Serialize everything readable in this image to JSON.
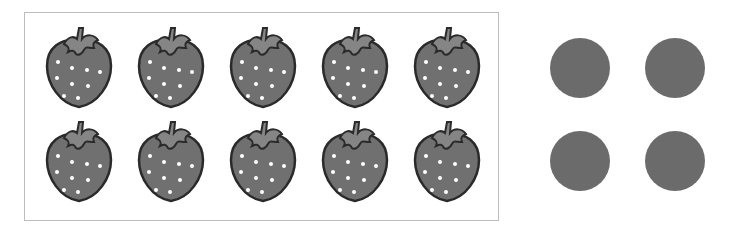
{
  "frame": {
    "label": "strawberries",
    "count": 10,
    "rows": 2,
    "columns": 5,
    "items": [
      {
        "kind": "strawberry"
      },
      {
        "kind": "strawberry"
      },
      {
        "kind": "strawberry"
      },
      {
        "kind": "strawberry"
      },
      {
        "kind": "strawberry"
      },
      {
        "kind": "strawberry"
      },
      {
        "kind": "strawberry"
      },
      {
        "kind": "strawberry"
      },
      {
        "kind": "strawberry"
      },
      {
        "kind": "strawberry"
      }
    ]
  },
  "dots": {
    "count": 4,
    "rows": 2,
    "columns": 2,
    "color": "#6b6b6b"
  },
  "colors": {
    "berry_body": "#707070",
    "berry_leaf": "#858585",
    "outline": "#2a2a2a",
    "seed": "#ffffff",
    "frame_border": "#bdbdbd"
  }
}
